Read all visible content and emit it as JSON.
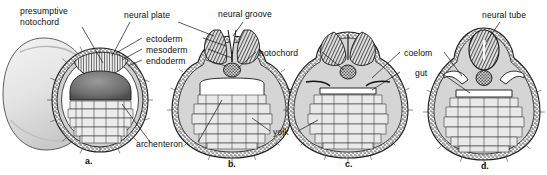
{
  "figure": {
    "background": "#ffffff",
    "ink": "#111111"
  },
  "labels": {
    "presumptive_notochord": "presumptive\nnotochord",
    "neural_plate": "neural plate",
    "neural_groove": "neural groove",
    "neural_tube": "neural tube",
    "ectoderm": "ectoderm",
    "mesoderm": "mesoderm",
    "endoderm": "endoderm",
    "notochord": "notochord",
    "coelom": "coelom",
    "gut": "gut",
    "yolk": "yolk",
    "archenteron": "archenteron"
  },
  "panels": [
    {
      "id": "a",
      "label": "a.",
      "stage": "neural plate stage, cut-away whole embryo"
    },
    {
      "id": "b",
      "label": "b.",
      "stage": "neural groove stage"
    },
    {
      "id": "c",
      "label": "c.",
      "stage": "neural folds closing"
    },
    {
      "id": "d",
      "label": "d.",
      "stage": "neural tube stage"
    }
  ]
}
